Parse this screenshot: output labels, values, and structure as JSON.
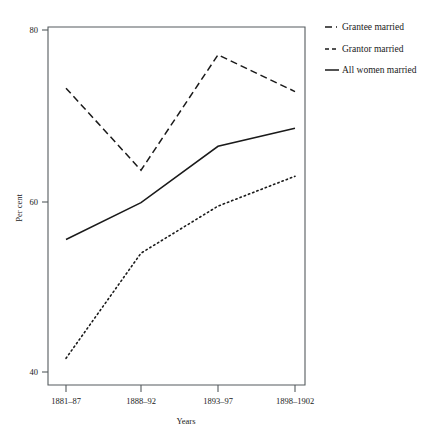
{
  "chart_data": {
    "type": "line",
    "title": "",
    "xlabel": "Years",
    "ylabel": "Per cent",
    "categories": [
      "1881–87",
      "1888–92",
      "1893–97",
      "1898–1902"
    ],
    "ylim": [
      38,
      81
    ],
    "yticks": [
      40,
      60,
      80
    ],
    "ytick_labels": [
      "40",
      "60",
      "80"
    ],
    "grid": false,
    "legend_position": "top-right",
    "series": [
      {
        "name": "Grantee married",
        "style": "long-dashed",
        "values": [
          73.2,
          63.6,
          77.1,
          72.8
        ]
      },
      {
        "name": "Grantor married",
        "style": "dotted",
        "values": [
          41.6,
          53.9,
          59.4,
          62.9
        ]
      },
      {
        "name": "All women married",
        "style": "solid",
        "values": [
          55.5,
          59.8,
          66.4,
          68.5
        ]
      }
    ]
  },
  "axes": {
    "y_label": "Per cent",
    "x_label": "Years",
    "y_tick_0": "40",
    "y_tick_1": "60",
    "y_tick_2": "80",
    "x_tick_0": "1881–87",
    "x_tick_1": "1888–92",
    "x_tick_2": "1893–97",
    "x_tick_3": "1898–1902"
  },
  "legend": {
    "items": [
      {
        "label": "Grantee married"
      },
      {
        "label": "Grantor married"
      },
      {
        "label": "All women married"
      }
    ]
  },
  "colors": {
    "ink": "#1a1a1a",
    "axis": "#555b5e",
    "background": "#ffffff"
  }
}
